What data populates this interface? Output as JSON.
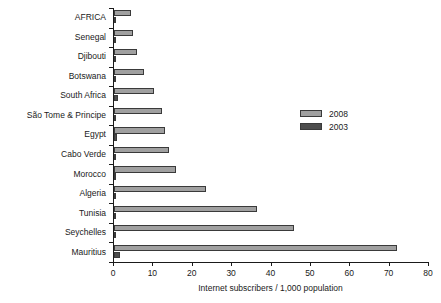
{
  "chart_data": {
    "type": "bar",
    "orientation": "horizontal",
    "title": "",
    "xlabel": "Internet subscribers / 1,000 population",
    "ylabel": "",
    "xlim": [
      0,
      80
    ],
    "xticks": [
      0,
      10,
      20,
      30,
      40,
      50,
      60,
      70,
      80
    ],
    "grid": false,
    "legend_position": "right",
    "categories": [
      "AFRICA",
      "Senegal",
      "Djibouti",
      "Botswana",
      "South Africa",
      "São Tome & Principe",
      "Egypt",
      "Cabo Verde",
      "Morocco",
      "Algeria",
      "Tunisia",
      "Seychelles",
      "Mauritius"
    ],
    "series": [
      {
        "name": "2008",
        "color": "#a0a0a0",
        "values": [
          4.2,
          4.7,
          5.8,
          7.7,
          10.2,
          12.2,
          13.0,
          14.0,
          15.7,
          23.3,
          36.3,
          45.7,
          71.8
        ]
      },
      {
        "name": "2003",
        "color": "#4d4d4d",
        "values": [
          0.3,
          0.4,
          0.2,
          0.3,
          0.9,
          0.3,
          0.7,
          0.2,
          0.3,
          0.6,
          0.4,
          0.5,
          1.5
        ]
      }
    ]
  },
  "legend": {
    "entries": [
      {
        "label": "2008",
        "color": "#a0a0a0"
      },
      {
        "label": "2003",
        "color": "#4d4d4d"
      }
    ]
  }
}
